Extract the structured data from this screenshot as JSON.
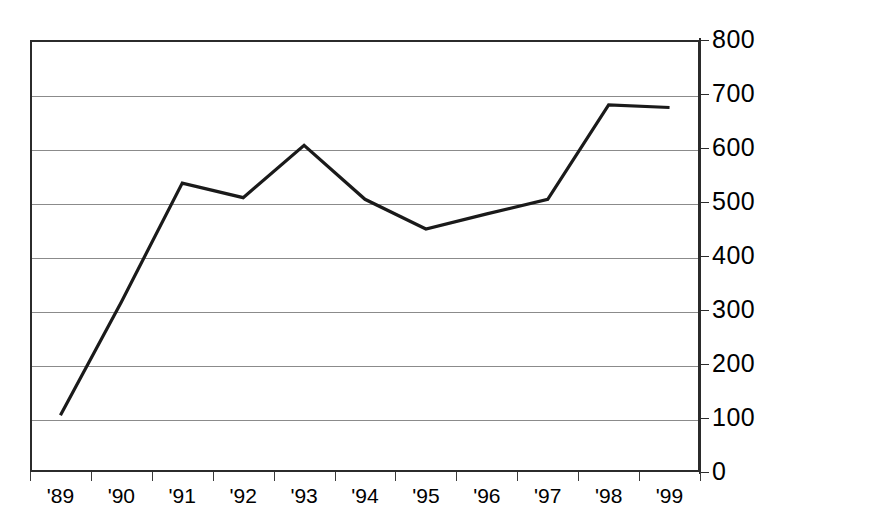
{
  "chart_data": {
    "type": "line",
    "title": "",
    "subtitle": "",
    "xlabel": "",
    "ylabel": "",
    "categories": [
      "'89",
      "'90",
      "'91",
      "'92",
      "'93",
      "'94",
      "'95",
      "'96",
      "'97",
      "'98",
      "'99"
    ],
    "series": [
      {
        "name": "",
        "values": [
          105,
          315,
          535,
          508,
          605,
          505,
          450,
          478,
          505,
          680,
          675
        ]
      }
    ],
    "ylim": [
      0,
      800
    ],
    "ytick_values": [
      0,
      100,
      200,
      300,
      400,
      500,
      600,
      700,
      800
    ],
    "ytick_labels": [
      "0",
      "100",
      "200",
      "300",
      "400",
      "500",
      "600",
      "700",
      "800"
    ],
    "y_axis_position": "right",
    "grid": true,
    "grid_axis": "y",
    "legend": "none",
    "annotations": [],
    "line_color": "#1a1a1a",
    "grid_color": "#8b8b8b",
    "axis_color": "#2b2b2b",
    "background_color": "#ffffff"
  }
}
